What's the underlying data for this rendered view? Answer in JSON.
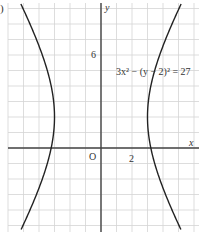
{
  "part_label": ")",
  "chart_data": {
    "type": "line",
    "title": "",
    "equation": "3x² − (y − 2)² = 27",
    "xlabel": "x",
    "ylabel": "y",
    "origin_label": "O",
    "x_tick_labels": [
      {
        "value": 2,
        "label": "2"
      }
    ],
    "y_tick_labels": [
      {
        "value": 6,
        "label": "6"
      }
    ],
    "xlim": [
      -6,
      6.2
    ],
    "ylim": [
      -5.5,
      9.5
    ],
    "grid": true,
    "grid_step": 1,
    "series": [
      {
        "name": "left branch",
        "x": [
          -6.2,
          -5.5,
          -5,
          -4.5,
          -4,
          -3.5,
          -3.2,
          -3,
          -3.2,
          -3.5,
          -4,
          -4.5,
          -5,
          -5.5
        ],
        "y": [
          10.3,
          9.07,
          8.0,
          6.94,
          5.87,
          4.67,
          3.56,
          2,
          0.44,
          -0.67,
          -1.87,
          -2.94,
          -4.0,
          -5.07
        ]
      },
      {
        "name": "right branch",
        "x": [
          5.5,
          5,
          4.5,
          4,
          3.5,
          3.2,
          3,
          3.2,
          3.5,
          4,
          4.5,
          5,
          5.5
        ],
        "y": [
          9.07,
          8.0,
          6.94,
          5.87,
          4.67,
          3.56,
          2,
          0.44,
          -0.67,
          -1.87,
          -2.94,
          -4.0,
          -5.07
        ]
      }
    ],
    "vertices": [
      {
        "x": -3,
        "y": 2
      },
      {
        "x": 3,
        "y": 2
      }
    ]
  }
}
